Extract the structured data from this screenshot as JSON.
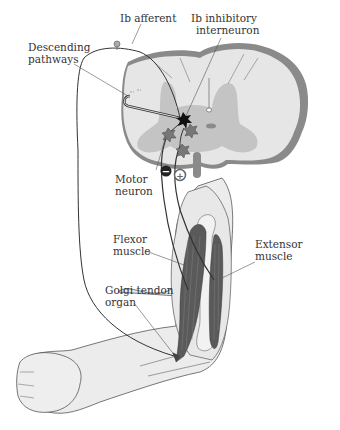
{
  "labels": {
    "ib_afferent": "Ib afferent",
    "ib_inhibitory_1": "Ib inhibitory",
    "ib_inhibitory_2": "interneuron",
    "descending_1": "Descending",
    "descending_2": "pathways",
    "motor_1": "Motor",
    "motor_2": "neuron",
    "flexor_1": "Flexor",
    "flexor_2": "muscle",
    "extensor_1": "Extensor",
    "extensor_2": "muscle",
    "golgi_1": "Golgi tendon",
    "golgi_2": "organ"
  },
  "symbols": {
    "inhibitory": "−",
    "excitatory": "+"
  },
  "colors": {
    "white_matter": "#e6e6e6",
    "gray_matter": "#c4c4c4",
    "pia_outline": "#8a8a8a",
    "muscle": "#5a5a5a",
    "skin": "#ececec",
    "nerve": "#333333"
  }
}
